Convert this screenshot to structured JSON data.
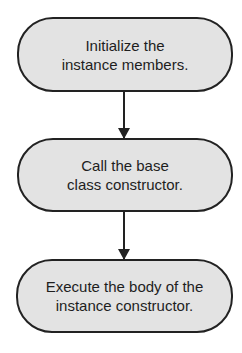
{
  "diagram": {
    "type": "flowchart",
    "direction": "top-to-bottom",
    "colors": {
      "node_fill": "#e3e3e3",
      "node_border": "#222222",
      "text": "#1e1e1e",
      "arrow": "#222222",
      "background": "#ffffff"
    },
    "nodes": [
      {
        "id": "n1",
        "line1": "Initialize the",
        "line2": "instance members."
      },
      {
        "id": "n2",
        "line1": "Call the base",
        "line2": "class constructor."
      },
      {
        "id": "n3",
        "line1": "Execute the body of the",
        "line2": "instance constructor."
      }
    ],
    "edges": [
      {
        "from": "n1",
        "to": "n2"
      },
      {
        "from": "n2",
        "to": "n3"
      }
    ]
  }
}
